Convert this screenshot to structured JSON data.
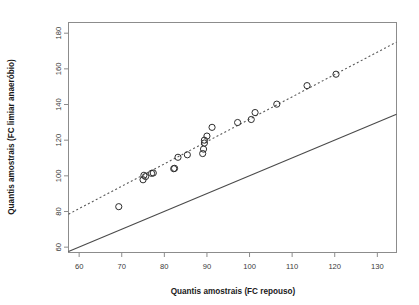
{
  "chart_data": {
    "type": "scatter",
    "title": "",
    "subtitle": "",
    "xlabel": "Quantis amostrais (FC repouso)",
    "ylabel": "Quantis amostrais (FC limiar anaeróbio)",
    "xlim": [
      57.5,
      134.5
    ],
    "ylim": [
      57.0,
      186.0
    ],
    "xticks": [
      60,
      70,
      80,
      90,
      100,
      110,
      120,
      130
    ],
    "yticks": [
      60,
      80,
      100,
      120,
      140,
      160,
      180
    ],
    "xtick_labels": [
      "60",
      "70",
      "80",
      "90",
      "100",
      "110",
      "120",
      "130"
    ],
    "ytick_labels": [
      "60",
      "80",
      "100",
      "120",
      "140",
      "160",
      "180"
    ],
    "grid": false,
    "legend": false,
    "legend_position": "none",
    "point_marker": "open-circle",
    "point_color": "#2e2e2e",
    "x": [
      69.3,
      75.0,
      75.2,
      75.6,
      77.0,
      77.4,
      82.2,
      82.4,
      83.2,
      85.4,
      89.0,
      89.2,
      89.4,
      89.4,
      90.0,
      91.2,
      97.2,
      100.4,
      101.3,
      106.4,
      113.5,
      120.3
    ],
    "y": [
      82.7,
      97.8,
      100.3,
      99.6,
      101.4,
      101.6,
      104.0,
      104.2,
      110.4,
      111.8,
      112.5,
      115.0,
      118.4,
      120.0,
      122.3,
      127.2,
      129.9,
      131.6,
      135.5,
      140.2,
      150.6,
      157.0
    ],
    "series": [
      {
        "name": "Quantis amostrais",
        "marker": "open-circle",
        "x": [
          69.3,
          75.0,
          75.2,
          75.6,
          77.0,
          77.4,
          82.2,
          82.4,
          83.2,
          85.4,
          89.0,
          89.2,
          89.4,
          89.4,
          90.0,
          91.2,
          97.2,
          100.4,
          101.3,
          106.4,
          113.5,
          120.3
        ],
        "y": [
          82.7,
          97.8,
          100.3,
          99.6,
          101.4,
          101.6,
          104.0,
          104.2,
          110.4,
          111.8,
          112.5,
          115.0,
          118.4,
          120.0,
          122.3,
          127.2,
          129.9,
          131.6,
          135.5,
          140.2,
          150.6,
          157.0
        ]
      }
    ],
    "lines": [
      {
        "name": "linha-identidade",
        "style": "solid",
        "color": "#4a4a4a",
        "x": [
          57.5,
          134.5
        ],
        "y": [
          57.5,
          134.5
        ]
      },
      {
        "name": "linha-ajuste",
        "style": "dashed",
        "color": "#5a5a5a",
        "x": [
          57.5,
          134.5
        ],
        "y": [
          78.5,
          175.0
        ]
      }
    ]
  },
  "axes": {
    "x_title": "Quantis amostrais (FC repouso)",
    "y_title": "Quantis amostrais (FC limiar anaeróbio)"
  }
}
